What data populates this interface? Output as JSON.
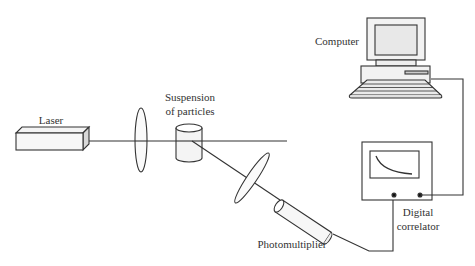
{
  "diagram": {
    "stroke_color": "#333333",
    "fill_color": "#f2f2f2",
    "components": [
      {
        "id": "laser",
        "label": "Laser"
      },
      {
        "id": "lens-1",
        "label": ""
      },
      {
        "id": "sample-cell",
        "label_lines": [
          "Suspension",
          "of particles"
        ]
      },
      {
        "id": "lens-2",
        "label": ""
      },
      {
        "id": "photomultiplier",
        "label": "Photomultiplier"
      },
      {
        "id": "correlator",
        "label_lines": [
          "Digital",
          "correlator"
        ]
      },
      {
        "id": "computer",
        "label": "Computer"
      }
    ],
    "connections": [
      {
        "from": "laser",
        "to": "sample-cell",
        "type": "beam"
      },
      {
        "from": "sample-cell",
        "to": "photomultiplier",
        "type": "scattered-beam"
      },
      {
        "from": "photomultiplier",
        "to": "correlator",
        "type": "cable"
      },
      {
        "from": "correlator",
        "to": "computer",
        "type": "cable"
      }
    ]
  },
  "labels": {
    "laser": "Laser",
    "suspension_line1": "Suspension",
    "suspension_line2": "of particles",
    "photomultiplier": "Photomultiplier",
    "correlator_line1": "Digital",
    "correlator_line2": "correlator",
    "computer": "Computer"
  }
}
